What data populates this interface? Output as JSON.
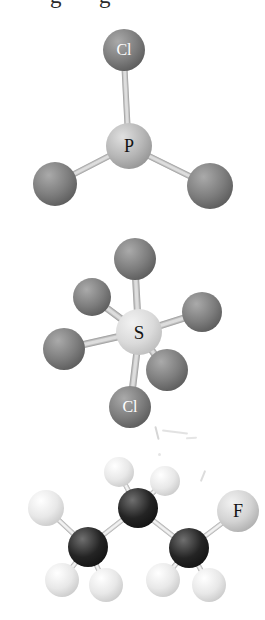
{
  "page": {
    "background": "#ffffff",
    "cropped_caption_remnants": [
      {
        "glyph": "g",
        "x": 50
      },
      {
        "glyph": "g",
        "x": 99
      }
    ]
  },
  "atom_styles": {
    "halogen-dark": {
      "highlight": "#aaaaaa",
      "body": "#7d7d7d",
      "edge": "#4b4b4b"
    },
    "phosphorus": {
      "highlight": "#e0e0e0",
      "body": "#b6b6b6",
      "edge": "#848484"
    },
    "sulfur": {
      "highlight": "#f2f2f2",
      "body": "#dadada",
      "edge": "#b0b0b0"
    },
    "carbon": {
      "highlight": "#6f6f6f",
      "body": "#242424",
      "edge": "#0b0b0b"
    },
    "hydrogen": {
      "highlight": "#ffffff",
      "body": "#e8e8e8",
      "edge": "#bcbcbc"
    },
    "fluorine": {
      "highlight": "#f2f2f2",
      "body": "#d3d3d3",
      "edge": "#9d9d9d"
    }
  },
  "molecules": [
    {
      "id": "phosphorus-trichloride",
      "bond_style": {
        "thickness": 6,
        "color_mid": "#dddddd",
        "color_edge": "#999999"
      },
      "atoms": [
        {
          "key": "Cl-top",
          "x": 124,
          "y": 50,
          "r": 21,
          "style": "halogen-dark",
          "label": "Cl",
          "label_color": "#ffffff",
          "label_size": 16
        },
        {
          "key": "P-center",
          "x": 129,
          "y": 146,
          "r": 23,
          "style": "phosphorus",
          "label": "P",
          "label_color": "#141414",
          "label_size": 18
        },
        {
          "key": "Cl-left",
          "x": 55,
          "y": 184,
          "r": 22,
          "style": "halogen-dark"
        },
        {
          "key": "Cl-right",
          "x": 210,
          "y": 186,
          "r": 23,
          "style": "halogen-dark"
        }
      ],
      "bonds": [
        [
          1,
          0
        ],
        [
          1,
          2
        ],
        [
          1,
          3
        ]
      ]
    },
    {
      "id": "sulfur-chloride-pentafluoride",
      "bond_style": {
        "thickness": 7,
        "color_mid": "#dddddd",
        "color_edge": "#999999"
      },
      "atoms": [
        {
          "key": "F-top",
          "x": 135,
          "y": 259,
          "r": 21,
          "style": "halogen-dark"
        },
        {
          "key": "F-upper-left",
          "x": 92,
          "y": 297,
          "r": 19,
          "style": "halogen-dark"
        },
        {
          "key": "F-right",
          "x": 202,
          "y": 312,
          "r": 20,
          "style": "halogen-dark"
        },
        {
          "key": "F-left",
          "x": 64,
          "y": 349,
          "r": 21,
          "style": "halogen-dark"
        },
        {
          "key": "S-center",
          "x": 139,
          "y": 332,
          "r": 23,
          "style": "sulfur",
          "label": "S",
          "label_color": "#141414",
          "label_size": 19
        },
        {
          "key": "F-lower-right",
          "x": 167,
          "y": 370,
          "r": 21,
          "style": "halogen-dark"
        },
        {
          "key": "Cl-bottom",
          "x": 130,
          "y": 407,
          "r": 21,
          "style": "halogen-dark",
          "label": "Cl",
          "label_color": "#ffffff",
          "label_size": 16
        }
      ],
      "bonds": [
        [
          4,
          0
        ],
        [
          4,
          1
        ],
        [
          4,
          2
        ],
        [
          4,
          3
        ],
        [
          4,
          5
        ],
        [
          4,
          6
        ]
      ]
    },
    {
      "id": "fluoropropane",
      "bond_style": {
        "thickness": 5,
        "color_mid": "#f1f1f1",
        "color_edge": "#a8a8a8"
      },
      "atoms": [
        {
          "key": "H-top-left",
          "x": 119,
          "y": 472,
          "r": 15,
          "style": "hydrogen"
        },
        {
          "key": "H-top-right",
          "x": 165,
          "y": 481,
          "r": 15,
          "style": "hydrogen"
        },
        {
          "key": "H-far-left",
          "x": 46,
          "y": 508,
          "r": 18,
          "style": "hydrogen"
        },
        {
          "key": "C-center",
          "x": 138,
          "y": 508,
          "r": 20,
          "style": "carbon"
        },
        {
          "key": "C-left",
          "x": 88,
          "y": 547,
          "r": 20,
          "style": "carbon"
        },
        {
          "key": "C-right",
          "x": 189,
          "y": 548,
          "r": 20,
          "style": "carbon"
        },
        {
          "key": "F-right",
          "x": 238,
          "y": 511,
          "r": 21,
          "style": "fluorine",
          "label": "F",
          "label_color": "#141414",
          "label_size": 18
        },
        {
          "key": "H-bottom-left",
          "x": 62,
          "y": 580,
          "r": 17,
          "style": "hydrogen"
        },
        {
          "key": "H-bottom-mid-1",
          "x": 106,
          "y": 585,
          "r": 17,
          "style": "hydrogen"
        },
        {
          "key": "H-bottom-mid-2",
          "x": 163,
          "y": 580,
          "r": 17,
          "style": "hydrogen"
        },
        {
          "key": "H-bottom-right",
          "x": 209,
          "y": 585,
          "r": 17,
          "style": "hydrogen"
        }
      ],
      "bonds": [
        [
          3,
          0
        ],
        [
          3,
          1
        ],
        [
          3,
          4
        ],
        [
          3,
          5
        ],
        [
          4,
          2
        ],
        [
          4,
          7
        ],
        [
          4,
          8
        ],
        [
          5,
          9
        ],
        [
          5,
          10
        ],
        [
          5,
          6
        ]
      ]
    }
  ],
  "artifacts": {
    "smudges": [
      {
        "x": 156,
        "y": 426,
        "w": 2,
        "h": 14,
        "rot": -14,
        "opacity": 0.35
      },
      {
        "x": 162,
        "y": 431,
        "w": 26,
        "h": 2,
        "rot": 7,
        "opacity": 0.25
      },
      {
        "x": 186,
        "y": 437,
        "w": 11,
        "h": 2,
        "rot": -4,
        "opacity": 0.22
      },
      {
        "x": 158,
        "y": 453,
        "w": 3,
        "h": 3,
        "rot": 0,
        "opacity": 0.22
      },
      {
        "x": 202,
        "y": 470,
        "w": 2,
        "h": 12,
        "rot": 22,
        "opacity": 0.3
      }
    ]
  }
}
